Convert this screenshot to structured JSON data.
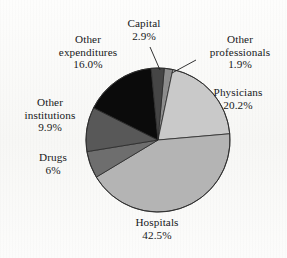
{
  "figure": {
    "background_color": "#fbfbfa",
    "text_color": "#17181a"
  },
  "chart_data": {
    "type": "pie",
    "title": "",
    "categories": [
      "Other professionals",
      "Physicians",
      "Hospitals",
      "Drugs",
      "Other institutions",
      "Other expenditures",
      "Capital"
    ],
    "values": [
      1.9,
      20.2,
      42.5,
      6.0,
      9.9,
      16.0,
      2.9
    ],
    "value_labels": [
      "1.9%",
      "20.2%",
      "42.5%",
      "6%",
      "9.9%",
      "16.0%",
      "2.9%"
    ],
    "units": "percent",
    "legend": "none",
    "labels_position": "outside-with-leader-lines",
    "start_angle_deg": -85,
    "direction": "clockwise",
    "slice_colors": [
      "#8c8c8c",
      "#c9c9c9",
      "#b4b4b4",
      "#6e6e6e",
      "#585858",
      "#0b0b0b",
      "#454545"
    ],
    "slice_edge_color": "#2a2a2a",
    "slices": [
      {
        "name": "Other professionals",
        "value": 1.9,
        "label": "1.9%",
        "color": "#8c8c8c"
      },
      {
        "name": "Physicians",
        "value": 20.2,
        "label": "20.2%",
        "color": "#c9c9c9"
      },
      {
        "name": "Hospitals",
        "value": 42.5,
        "label": "42.5%",
        "color": "#b4b4b4"
      },
      {
        "name": "Drugs",
        "value": 6.0,
        "label": "6%",
        "color": "#6e6e6e"
      },
      {
        "name": "Other institutions",
        "value": 9.9,
        "label": "9.9%",
        "color": "#585858"
      },
      {
        "name": "Other expenditures",
        "value": 16.0,
        "label": "16.0%",
        "color": "#0b0b0b"
      },
      {
        "name": "Capital",
        "value": 2.9,
        "label": "2.9%",
        "color": "#454545"
      }
    ]
  },
  "labels": {
    "capital": {
      "line1": "Capital",
      "pct": "2.9%"
    },
    "other_professionals": {
      "line1": "Other",
      "line2": "professionals",
      "pct": "1.9%"
    },
    "physicians": {
      "line1": "Physicians",
      "pct": "20.2%"
    },
    "hospitals": {
      "line1": "Hospitals",
      "pct": "42.5%"
    },
    "drugs": {
      "line1": "Drugs",
      "pct": "6%"
    },
    "other_institutions": {
      "line1": "Other",
      "line2": "institutions",
      "pct": "9.9%"
    },
    "other_expenditures": {
      "line1": "Other",
      "line2": "expenditures",
      "pct": "16.0%"
    }
  }
}
